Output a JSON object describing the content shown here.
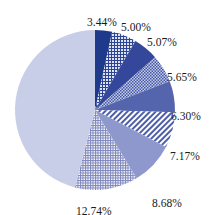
{
  "chart_data": {
    "type": "pie",
    "title": "",
    "start_angle_deg": 0,
    "direction": "clockwise",
    "center": [
      95,
      110
    ],
    "radius": 80,
    "slices": [
      {
        "label": "3.44%",
        "value": 3.44,
        "color": "#1f3a8a",
        "pattern": "solid"
      },
      {
        "label": "5.00%",
        "value": 5.0,
        "color": "#2d4496",
        "pattern": "grid",
        "bg": "#dde2f0"
      },
      {
        "label": "5.07%",
        "value": 5.07,
        "color": "#34479a",
        "pattern": "solid"
      },
      {
        "label": "5.65%",
        "value": 5.65,
        "color": "#4558a6",
        "pattern": "checker",
        "bg": "#c4cbe6"
      },
      {
        "label": "6.30%",
        "value": 6.3,
        "color": "#5565ad",
        "pattern": "solid"
      },
      {
        "label": "7.17%",
        "value": 7.17,
        "color": "#4e5ea8",
        "pattern": "diagonal",
        "bg": "#ffffff"
      },
      {
        "label": "8.68%",
        "value": 8.68,
        "color": "#8e98cc",
        "pattern": "solid"
      },
      {
        "label": "12.74%",
        "value": 12.74,
        "color": "#7c86bd",
        "pattern": "fine-grid",
        "bg": "#ffffff"
      },
      {
        "label": "",
        "value": 45.95,
        "color": "#c9cee8",
        "pattern": "solid"
      }
    ],
    "label_positions": [
      [
        87,
        26
      ],
      [
        121,
        31
      ],
      [
        147,
        46
      ],
      [
        167,
        81
      ],
      [
        171,
        120
      ],
      [
        170,
        160
      ],
      [
        152,
        207
      ],
      [
        76,
        215
      ],
      null
    ]
  }
}
